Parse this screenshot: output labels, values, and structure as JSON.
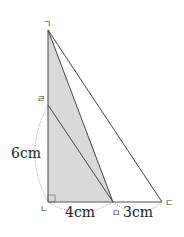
{
  "diagram": {
    "type": "geometry-right-triangle",
    "fill_color": "#d9d9d9",
    "line_color": "#444444",
    "points": {
      "top": {
        "label": "ㄱ",
        "x": 48,
        "y": 30
      },
      "left_mid": {
        "label": "ㄹ",
        "x": 48,
        "y": 105
      },
      "bottom_left": {
        "label": "ㄴ",
        "x": 48,
        "y": 202
      },
      "bottom_mid": {
        "label": "ㅁ",
        "x": 113,
        "y": 202
      },
      "bottom_right": {
        "label": "ㄷ",
        "x": 162,
        "y": 202
      }
    },
    "measurements": {
      "left_segment": "6cm",
      "bottom_left_segment": "4cm",
      "bottom_right_segment": "3cm"
    }
  }
}
